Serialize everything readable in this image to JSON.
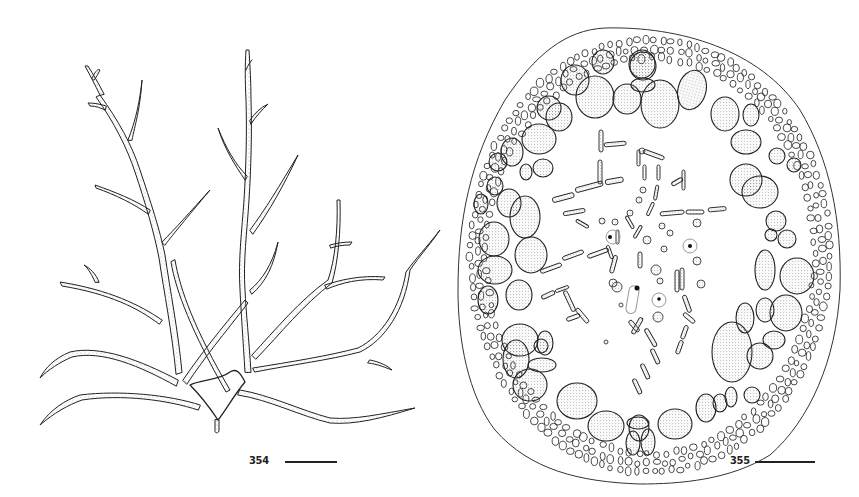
{
  "figures": [
    {
      "number": "354",
      "subject": "branched thallus habit drawing",
      "scale_bar": true
    },
    {
      "number": "355",
      "subject": "transverse section of thallus showing cortex and medullary filaments",
      "scale_bar": true
    }
  ],
  "colors": {
    "ink": "#222222",
    "stipple": "#555555",
    "background": "#ffffff"
  }
}
